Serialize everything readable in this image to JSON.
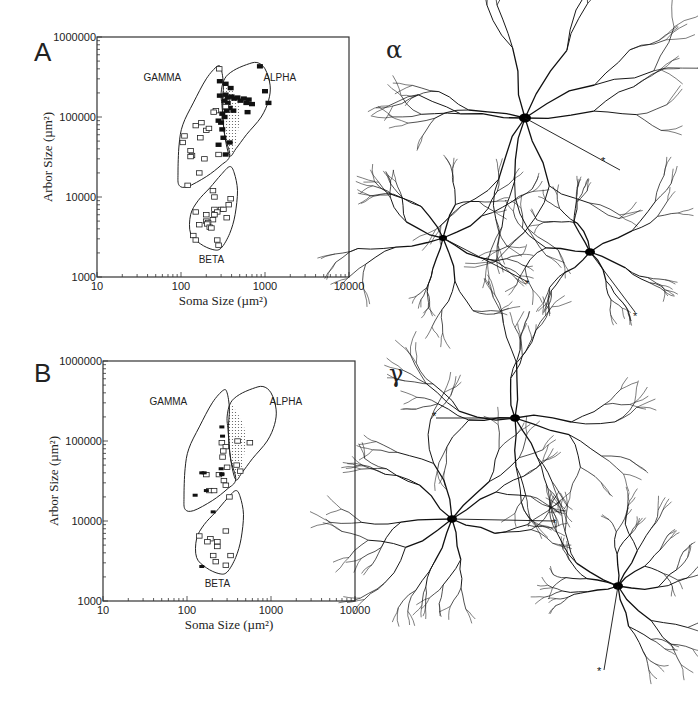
{
  "figure": {
    "panels": [
      {
        "letter": "A"
      },
      {
        "letter": "B"
      }
    ],
    "neuron_groups": [
      {
        "symbol": "α",
        "label": "alpha cells",
        "markers": [
          "*",
          "*",
          "*"
        ]
      },
      {
        "symbol": "γ",
        "label": "gamma cells",
        "markers": [
          "*",
          "*",
          "*"
        ]
      }
    ]
  },
  "chart_data": [
    {
      "panel": "A",
      "type": "scatter",
      "title": "",
      "xlabel": "Soma Size (µm²)",
      "ylabel": "Arbor Size (µm²)",
      "xscale": "log",
      "yscale": "log",
      "xlim": [
        10,
        10000
      ],
      "ylim": [
        1000,
        1000000
      ],
      "xticks": [
        "10",
        "100",
        "1000",
        "10000"
      ],
      "yticks": [
        "1000",
        "10000",
        "100000",
        "1000000"
      ],
      "grid": false,
      "regions": [
        {
          "name": "GAMMA",
          "label_pos": [
            60,
            320000
          ]
        },
        {
          "name": "ALPHA",
          "label_pos": [
            1500,
            320000
          ]
        },
        {
          "name": "BETA",
          "label_pos": [
            230,
            1700
          ]
        }
      ],
      "series": [
        {
          "name": "alpha (filled)",
          "marker": "filled-square",
          "points": [
            [
              290,
              280000
            ],
            [
              340,
              260000
            ],
            [
              870,
              430000
            ],
            [
              390,
              230000
            ],
            [
              290,
              185000
            ],
            [
              340,
              190000
            ],
            [
              360,
              175000
            ],
            [
              400,
              180000
            ],
            [
              430,
              170000
            ],
            [
              470,
              175000
            ],
            [
              510,
              160000
            ],
            [
              560,
              170000
            ],
            [
              600,
              150000
            ],
            [
              640,
              165000
            ],
            [
              700,
              145000
            ],
            [
              1000,
              210000
            ],
            [
              1100,
              150000
            ],
            [
              360,
              150000
            ],
            [
              330,
              160000
            ],
            [
              380,
              130000
            ],
            [
              350,
              120000
            ],
            [
              310,
              110000
            ],
            [
              330,
              100000
            ],
            [
              300,
              85000
            ],
            [
              280,
              90000
            ],
            [
              310,
              70000
            ],
            [
              320,
              55000
            ],
            [
              280,
              45000
            ],
            [
              380,
              48000
            ],
            [
              340,
              34000
            ],
            [
              620,
              115000
            ],
            [
              420,
              120000
            ]
          ]
        },
        {
          "name": "gamma (open)",
          "marker": "open-square",
          "points": [
            [
              285,
              400000
            ],
            [
              340,
              135000
            ],
            [
              260,
              120000
            ],
            [
              245,
              115000
            ],
            [
              150,
              78000
            ],
            [
              175,
              85000
            ],
            [
              200,
              68000
            ],
            [
              215,
              72000
            ],
            [
              110,
              58000
            ],
            [
              105,
              48000
            ],
            [
              170,
              55000
            ],
            [
              130,
              38000
            ],
            [
              135,
              33000
            ],
            [
              130,
              32000
            ],
            [
              190,
              30000
            ],
            [
              280,
              34000
            ],
            [
              165,
              20000
            ],
            [
              120,
              14000
            ]
          ]
        },
        {
          "name": "beta (open)",
          "marker": "open-square",
          "points": [
            [
              240,
              12000
            ],
            [
              250,
              10000
            ],
            [
              390,
              9500
            ],
            [
              370,
              8000
            ],
            [
              150,
              6500
            ],
            [
              200,
              6000
            ],
            [
              300,
              7000
            ],
            [
              320,
              7000
            ],
            [
              250,
              7000
            ],
            [
              270,
              6500
            ],
            [
              250,
              6000
            ],
            [
              350,
              5500
            ],
            [
              240,
              5200
            ],
            [
              200,
              5000
            ],
            [
              210,
              4800
            ],
            [
              165,
              4500
            ],
            [
              205,
              4600
            ],
            [
              220,
              4200
            ],
            [
              230,
              4100
            ],
            [
              140,
              3300
            ],
            [
              150,
              2900
            ],
            [
              270,
              2900
            ],
            [
              280,
              2500
            ]
          ]
        }
      ]
    },
    {
      "panel": "B",
      "type": "scatter",
      "title": "",
      "xlabel": "Soma Size (µm²)",
      "ylabel": "Arbor Size (µm²)",
      "xscale": "log",
      "yscale": "log",
      "xlim": [
        10,
        10000
      ],
      "ylim": [
        1000,
        1000000
      ],
      "xticks": [
        "10",
        "100",
        "1000",
        "10000"
      ],
      "yticks": [
        "1000",
        "10000",
        "100000",
        "1000000"
      ],
      "grid": false,
      "regions": [
        {
          "name": "GAMMA",
          "label_pos": [
            60,
            320000
          ]
        },
        {
          "name": "ALPHA",
          "label_pos": [
            1500,
            320000
          ]
        },
        {
          "name": "BETA",
          "label_pos": [
            230,
            1700
          ]
        }
      ],
      "series": [
        {
          "name": "open squares",
          "marker": "open-square",
          "points": [
            [
              260,
              95000
            ],
            [
              400,
              100000
            ],
            [
              560,
              95000
            ],
            [
              290,
              85000
            ],
            [
              270,
              75000
            ],
            [
              265,
              63000
            ],
            [
              300,
              47000
            ],
            [
              390,
              50000
            ],
            [
              430,
              42000
            ],
            [
              240,
              38000
            ],
            [
              275,
              32000
            ],
            [
              290,
              28000
            ],
            [
              170,
              38000
            ],
            [
              185,
              24000
            ],
            [
              210,
              24000
            ],
            [
              320,
              20000
            ],
            [
              290,
              7500
            ],
            [
              140,
              6500
            ],
            [
              190,
              6000
            ],
            [
              175,
              5500
            ],
            [
              230,
              5500
            ],
            [
              230,
              4800
            ],
            [
              205,
              3700
            ],
            [
              330,
              3700
            ],
            [
              220,
              3100
            ],
            [
              290,
              2800
            ]
          ]
        },
        {
          "name": "filled marks",
          "marker": "filled-dash",
          "points": [
            [
              260,
              150000
            ],
            [
              265,
              115000
            ],
            [
              255,
              45000
            ],
            [
              260,
              38000
            ],
            [
              150,
              40000
            ],
            [
              160,
              40000
            ],
            [
              170,
              24000
            ],
            [
              125,
              21000
            ],
            [
              205,
              13000
            ],
            [
              150,
              2700
            ],
            [
              260,
              39000
            ]
          ]
        }
      ]
    }
  ]
}
